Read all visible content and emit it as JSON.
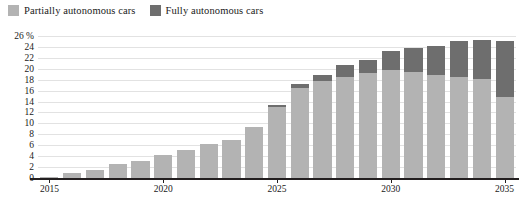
{
  "legend": {
    "position": "top-left",
    "items": [
      {
        "label": "Partially autonomous cars",
        "color": "#b3b3b3",
        "key": "partially"
      },
      {
        "label": "Fully autonomous cars",
        "color": "#6e6e6e",
        "key": "fully"
      }
    ]
  },
  "axis": {
    "y_unit": "%",
    "y_ticks": [
      "26 %",
      "24",
      "22",
      "20",
      "18",
      "16",
      "14",
      "12",
      "10",
      "8",
      "6",
      "4",
      "2",
      "0"
    ],
    "y_tick_values": [
      26,
      24,
      22,
      20,
      18,
      16,
      14,
      12,
      10,
      8,
      6,
      4,
      2,
      0
    ],
    "x_ticks": [
      "2015",
      "2020",
      "2025",
      "2030",
      "2035"
    ],
    "x_tick_values": [
      2015,
      2020,
      2025,
      2030,
      2035
    ]
  },
  "colors": {
    "partially": "#b3b3b3",
    "fully": "#6e6e6e",
    "grid": "#e2e2e2",
    "axis": "#231f20",
    "text": "#1a1a1a",
    "background": "#ffffff"
  },
  "chart_data": {
    "type": "bar",
    "stacked": true,
    "title": "",
    "subtitle": "",
    "xlabel": "",
    "ylabel": "",
    "ylim": [
      0,
      26
    ],
    "y_unit": "%",
    "grid": true,
    "legend_position": "top-left",
    "categories": [
      "2015",
      "2016",
      "2017",
      "2018",
      "2019",
      "2020",
      "2021",
      "2022",
      "2023",
      "2024",
      "2025",
      "2026",
      "2027",
      "2028",
      "2029",
      "2030",
      "2031",
      "2032",
      "2033",
      "2034",
      "2035"
    ],
    "series": [
      {
        "name": "Partially autonomous cars",
        "color": "#b3b3b3",
        "values": [
          0.2,
          1.0,
          1.5,
          2.5,
          3.2,
          4.2,
          5.2,
          6.3,
          7.0,
          9.3,
          13.0,
          16.5,
          17.8,
          18.5,
          19.3,
          19.8,
          19.4,
          18.8,
          18.5,
          18.2,
          14.8
        ]
      },
      {
        "name": "Fully autonomous cars",
        "color": "#6e6e6e",
        "values": [
          0.0,
          0.0,
          0.0,
          0.0,
          0.0,
          0.0,
          0.0,
          0.0,
          0.0,
          0.0,
          0.4,
          0.7,
          1.1,
          2.2,
          2.3,
          3.5,
          4.4,
          5.4,
          6.5,
          7.0,
          10.3
        ]
      }
    ],
    "totals": [
      0.2,
      1.0,
      1.5,
      2.5,
      3.2,
      4.2,
      5.2,
      6.3,
      7.0,
      9.3,
      13.4,
      17.2,
      18.9,
      20.7,
      21.6,
      23.3,
      23.8,
      24.2,
      25.0,
      25.2,
      25.1
    ]
  }
}
